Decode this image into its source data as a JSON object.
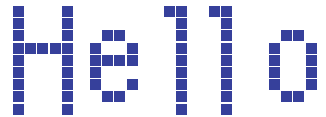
{
  "canvas": {
    "width": 326,
    "height": 117,
    "background_color": "#ffffff",
    "pixel_color": "#36409B",
    "cell_size": 11,
    "cell_gap": 1.2,
    "description": "Bitmap pixel-font rendering of the word Hello"
  },
  "text": {
    "content": "Hello",
    "characters": [
      "H",
      "e",
      "l",
      "l",
      "o"
    ]
  },
  "glyphs": [
    {
      "char": "H",
      "name": "glyph-H",
      "origin_x": 13,
      "origin_y": 6,
      "cols": 5,
      "rows": 9,
      "bitmap": [
        "1...1",
        "1...1",
        "1...1",
        "11111",
        "1...1",
        "1...1",
        "1...1",
        "1...1",
        "1...1"
      ]
    },
    {
      "char": "e",
      "name": "glyph-e",
      "origin_x": 90,
      "origin_y": 6,
      "cols": 4,
      "rows": 9,
      "bitmap": [
        "....",
        "....",
        ".11.",
        "1..1",
        "1111",
        "1...",
        "1..1",
        ".11.",
        "...."
      ]
    },
    {
      "char": "l",
      "name": "glyph-l-first",
      "origin_x": 164,
      "origin_y": 6,
      "cols": 2,
      "rows": 9,
      "bitmap": [
        "11",
        ".1",
        ".1",
        ".1",
        ".1",
        ".1",
        ".1",
        ".1",
        ".1"
      ]
    },
    {
      "char": "l",
      "name": "glyph-l-second",
      "origin_x": 209,
      "origin_y": 6,
      "cols": 2,
      "rows": 9,
      "bitmap": [
        "11",
        ".1",
        ".1",
        ".1",
        ".1",
        ".1",
        ".1",
        ".1",
        ".1"
      ]
    },
    {
      "char": "o",
      "name": "glyph-o",
      "origin_x": 269,
      "origin_y": 6,
      "cols": 4,
      "rows": 9,
      "bitmap": [
        "....",
        "....",
        ".11.",
        "1..1",
        "1..1",
        "1..1",
        "1..1",
        ".11.",
        "...."
      ]
    }
  ]
}
